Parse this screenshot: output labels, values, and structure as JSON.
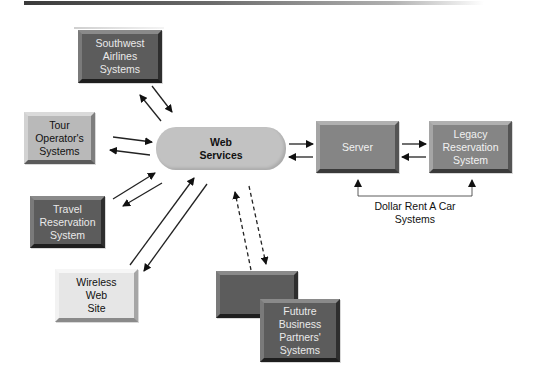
{
  "diagram": {
    "center_node": {
      "id": "web-services",
      "label": "Web\nServices",
      "shape": "rounded-cylinder",
      "color": "#c2c2c2"
    },
    "nodes": [
      {
        "id": "southwest",
        "label": "Southwest\nAirlines\nSystems",
        "color": "#5c5c5c"
      },
      {
        "id": "tour-operator",
        "label": "Tour\nOperator's\nSystems",
        "color": "#b9b9b9"
      },
      {
        "id": "travel-reservation",
        "label": "Travel\nReservation\nSystem",
        "color": "#5c5c5c"
      },
      {
        "id": "wireless",
        "label": "Wireless\nWeb\nSite",
        "color": "#e6e6e6"
      },
      {
        "id": "server",
        "label": "Server",
        "color": "#858585"
      },
      {
        "id": "legacy",
        "label": "Legacy\nReservation\nSystem",
        "color": "#858585"
      },
      {
        "id": "future-back",
        "label": "",
        "color": "#5c5c5c"
      },
      {
        "id": "future-partners",
        "label": "Fututre\nBusiness\nPartners'\nSystems",
        "color": "#5c5c5c"
      }
    ],
    "group_label": "Dollar Rent A Car\nSystems",
    "edges": [
      {
        "from": "web-services",
        "to": "southwest",
        "style": "solid"
      },
      {
        "from": "southwest",
        "to": "web-services",
        "style": "solid"
      },
      {
        "from": "tour-operator",
        "to": "web-services",
        "style": "solid"
      },
      {
        "from": "web-services",
        "to": "tour-operator",
        "style": "solid"
      },
      {
        "from": "travel-reservation",
        "to": "web-services",
        "style": "solid"
      },
      {
        "from": "web-services",
        "to": "travel-reservation",
        "style": "solid"
      },
      {
        "from": "wireless",
        "to": "web-services",
        "style": "solid"
      },
      {
        "from": "web-services",
        "to": "wireless",
        "style": "solid"
      },
      {
        "from": "future-partners",
        "to": "web-services",
        "style": "dashed"
      },
      {
        "from": "web-services",
        "to": "future-partners",
        "style": "dashed"
      },
      {
        "from": "web-services",
        "to": "server",
        "style": "solid"
      },
      {
        "from": "server",
        "to": "web-services",
        "style": "solid"
      },
      {
        "from": "server",
        "to": "legacy",
        "style": "solid"
      },
      {
        "from": "legacy",
        "to": "server",
        "style": "solid"
      }
    ]
  }
}
